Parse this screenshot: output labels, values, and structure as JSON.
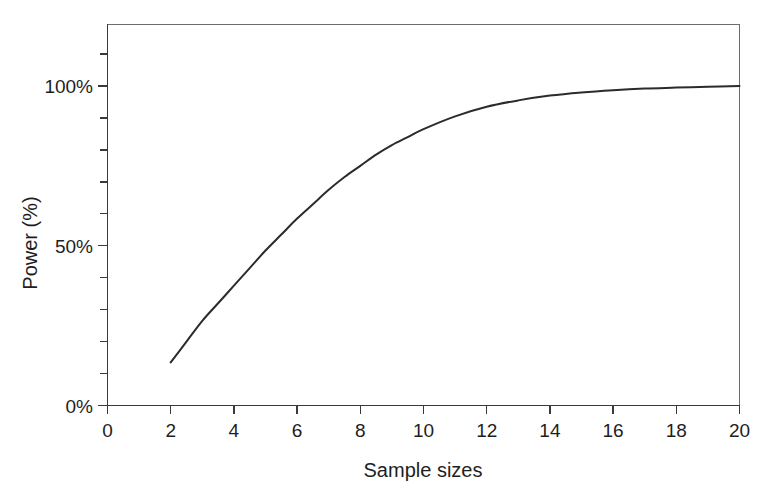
{
  "chart_data": {
    "type": "line",
    "title": "",
    "xlabel": "Sample sizes",
    "ylabel": "Power (%)",
    "xlim": [
      0,
      20
    ],
    "ylim": [
      0,
      120
    ],
    "grid": false,
    "legend": null,
    "x_ticks": [
      0,
      2,
      4,
      6,
      8,
      10,
      12,
      14,
      16,
      18,
      20
    ],
    "x_tick_labels": [
      "0",
      "2",
      "4",
      "6",
      "8",
      "10",
      "12",
      "14",
      "16",
      "18",
      "20"
    ],
    "y_ticks": [
      0,
      50,
      100
    ],
    "y_tick_labels": [
      "0%",
      "50%",
      "100%"
    ],
    "y_minor_ticks": [
      10,
      20,
      30,
      40,
      60,
      70,
      80,
      90,
      110
    ],
    "series": [
      {
        "name": "Power curve",
        "color": "#2b2b2b",
        "x": [
          2,
          2.5,
          3,
          3.5,
          4,
          4.5,
          5,
          5.5,
          6,
          6.5,
          7,
          7.5,
          8,
          8.5,
          9,
          9.5,
          10,
          11,
          12,
          13,
          14,
          15,
          16,
          17,
          18,
          19,
          20
        ],
        "values": [
          13.5,
          20.0,
          26.5,
          32.0,
          37.5,
          43.0,
          48.5,
          53.5,
          58.5,
          63.0,
          67.5,
          71.5,
          75.0,
          78.5,
          81.5,
          84.0,
          86.5,
          90.5,
          93.5,
          95.5,
          97.0,
          98.0,
          98.7,
          99.2,
          99.5,
          99.8,
          100.0
        ]
      }
    ]
  },
  "axis": {
    "y_label": "Power (%)",
    "x_label": "Sample sizes"
  },
  "colors": {
    "curve": "#2b2b2b",
    "axis": "#3a3a3a",
    "frame": "#6d6d6d",
    "background": "#ffffff",
    "text": "#1e1e1e"
  }
}
